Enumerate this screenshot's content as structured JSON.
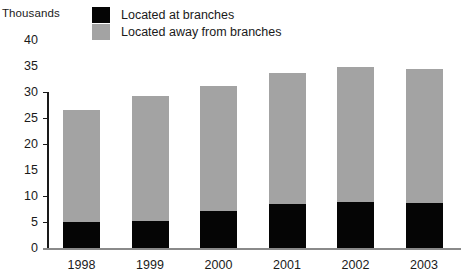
{
  "axis_unit_caption": "Thousands",
  "legend": {
    "position": "top-center",
    "entries": [
      {
        "label": "Located at branches",
        "color": "#050505",
        "swatch_name": "legend-swatch-at-branches"
      },
      {
        "label": "Located away from branches",
        "color": "#a3a3a3",
        "swatch_name": "legend-swatch-away-from-branches"
      }
    ]
  },
  "chart_data": {
    "type": "bar",
    "subtype": "stacked",
    "title": "",
    "xlabel": "",
    "ylabel": "Thousands",
    "categories": [
      "1998",
      "1999",
      "2000",
      "2001",
      "2002",
      "2003"
    ],
    "series": [
      {
        "name": "Located at branches",
        "color": "#050505",
        "values": [
          5.0,
          5.2,
          7.1,
          8.5,
          8.9,
          8.6
        ]
      },
      {
        "name": "Located away from branches",
        "color": "#a3a3a3",
        "values": [
          21.6,
          24.1,
          24.1,
          25.2,
          26.0,
          25.8
        ]
      }
    ],
    "totals": [
      26.6,
      29.3,
      31.2,
      33.7,
      34.9,
      34.4
    ],
    "ylim": [
      0,
      40
    ],
    "yticks": [
      0,
      5,
      10,
      15,
      20,
      25,
      30,
      35,
      40
    ],
    "ytick_labels": [
      "0",
      "5",
      "10",
      "15",
      "20",
      "25",
      "30",
      "35",
      "40"
    ],
    "y_axis_spine_range": [
      0,
      30
    ],
    "tickmark_values": [
      0,
      5,
      10,
      20,
      25,
      30
    ],
    "grid": false,
    "legend_position": "top-center"
  }
}
